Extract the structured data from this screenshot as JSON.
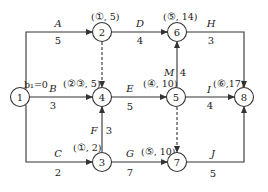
{
  "diagram": {
    "type": "activity-on-arrow network",
    "nodes": [
      {
        "id": "1",
        "x": 20,
        "y": 97
      },
      {
        "id": "2",
        "x": 102,
        "y": 32
      },
      {
        "id": "3",
        "x": 102,
        "y": 162
      },
      {
        "id": "4",
        "x": 102,
        "y": 97
      },
      {
        "id": "5",
        "x": 176,
        "y": 97
      },
      {
        "id": "6",
        "x": 177,
        "y": 32
      },
      {
        "id": "7",
        "x": 177,
        "y": 162
      },
      {
        "id": "8",
        "x": 244,
        "y": 97
      }
    ],
    "activities": [
      {
        "name": "A",
        "duration": "5",
        "from": "1",
        "to": "2"
      },
      {
        "name": "B",
        "duration": "3",
        "from": "1",
        "to": "4"
      },
      {
        "name": "C",
        "duration": "2",
        "from": "1",
        "to": "3"
      },
      {
        "name": "D",
        "duration": "4",
        "from": "2",
        "to": "6"
      },
      {
        "name": "E",
        "duration": "5",
        "from": "4",
        "to": "5"
      },
      {
        "name": "F",
        "duration": "3",
        "from": "3",
        "to": "4"
      },
      {
        "name": "G",
        "duration": "7",
        "from": "3",
        "to": "7"
      },
      {
        "name": "H",
        "duration": "3",
        "from": "6",
        "to": "8"
      },
      {
        "name": "I",
        "duration": "4",
        "from": "5",
        "to": "8"
      },
      {
        "name": "J",
        "duration": "5",
        "from": "7",
        "to": "8"
      },
      {
        "name": "M",
        "duration": "4",
        "from": "5",
        "to": "6"
      }
    ],
    "dummies": [
      {
        "from": "2",
        "to": "4"
      },
      {
        "from": "5",
        "to": "7"
      }
    ],
    "node_tags": {
      "1": "b₁=0",
      "2": "(①, 5)",
      "3": "(①, 2)",
      "4": "(②③, 5)",
      "5": "(④, 10)",
      "6": "(⑤, 14)",
      "7": "(⑤, 10)",
      "8": "(⑥,17)"
    }
  }
}
